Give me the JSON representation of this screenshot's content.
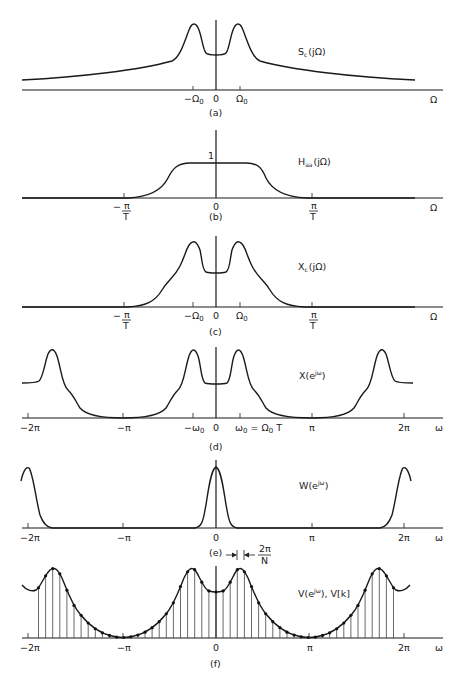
{
  "figure": {
    "panels": [
      {
        "id": "a",
        "caption": "(a)",
        "function_label": "S_c(jΩ)",
        "func_main": "S",
        "func_sub": "c",
        "func_arg": "(jΩ)",
        "axis_variable": "Ω",
        "ticks": [
          "−Ω0",
          "0",
          "Ω0"
        ],
        "tick_minus": "−Ω",
        "tick_plus": "Ω",
        "tick_sub": "0",
        "tick_zero": "0"
      },
      {
        "id": "b",
        "caption": "(b)",
        "function_label": "H_aa(jΩ)",
        "func_main": "H",
        "func_sub": "aa",
        "func_arg": "(jΩ)",
        "axis_variable": "Ω",
        "ticks": [
          "−π/T",
          "0",
          "π/T"
        ],
        "neg_sign": "−",
        "frac_num": "π",
        "frac_den": "T",
        "tick_zero": "0",
        "level_label": "1"
      },
      {
        "id": "c",
        "caption": "(c)",
        "function_label": "X_c(jΩ)",
        "func_main": "X",
        "func_sub": "c",
        "func_arg": "(jΩ)",
        "axis_variable": "Ω",
        "ticks": [
          "−π/T",
          "−Ω0",
          "0",
          "Ω0",
          "π/T"
        ],
        "neg_sign": "−",
        "frac_num": "π",
        "frac_den": "T",
        "tick_minus": "−Ω",
        "tick_plus": "Ω",
        "tick_sub": "0",
        "tick_zero": "0"
      },
      {
        "id": "d",
        "caption": "(d)",
        "function_label": "X(e^{jω})",
        "func_main": "X(e",
        "func_sup": "jω",
        "func_close": ")",
        "axis_variable": "ω",
        "ticks": [
          "−2π",
          "−π",
          "−ω0",
          "0",
          "ω0 = Ω0 T",
          "π",
          "2π"
        ],
        "t_m2pi": "−2π",
        "t_mpi": "−π",
        "t_mw0": "−ω",
        "t_sub": "0",
        "t_zero": "0",
        "t_w0": "ω",
        "t_eq": " = Ω",
        "t_T": " T",
        "t_pi": "π",
        "t_2pi": "2π"
      },
      {
        "id": "e",
        "caption": "(e)",
        "function_label": "W(e^{jω})",
        "func_main": "W(e",
        "func_sup": "jω",
        "func_close": ")",
        "axis_variable": "ω",
        "ticks": [
          "−2π",
          "−π",
          "0",
          "π",
          "2π"
        ],
        "t_m2pi": "−2π",
        "t_mpi": "−π",
        "t_zero": "0",
        "t_pi": "π",
        "t_2pi": "2π",
        "spacing_annotation": "2π/N",
        "spacing_num": "2π",
        "spacing_den": "N"
      },
      {
        "id": "f",
        "caption": "(f)",
        "function_label": "V(e^{jω}), V[k]",
        "func_main": "V(e",
        "func_sup": "jω",
        "func_close": "), V[k]",
        "axis_variable": "ω",
        "ticks": [
          "−2π",
          "−π",
          "0",
          "π",
          "2π"
        ],
        "t_m2pi": "−2π",
        "t_mpi": "−π",
        "t_zero": "0",
        "t_pi": "π",
        "t_2pi": "2π",
        "sample_spacing_px": 7.1
      }
    ],
    "colors": {
      "ink": "#1a1a1a",
      "background": "#ffffff"
    }
  }
}
